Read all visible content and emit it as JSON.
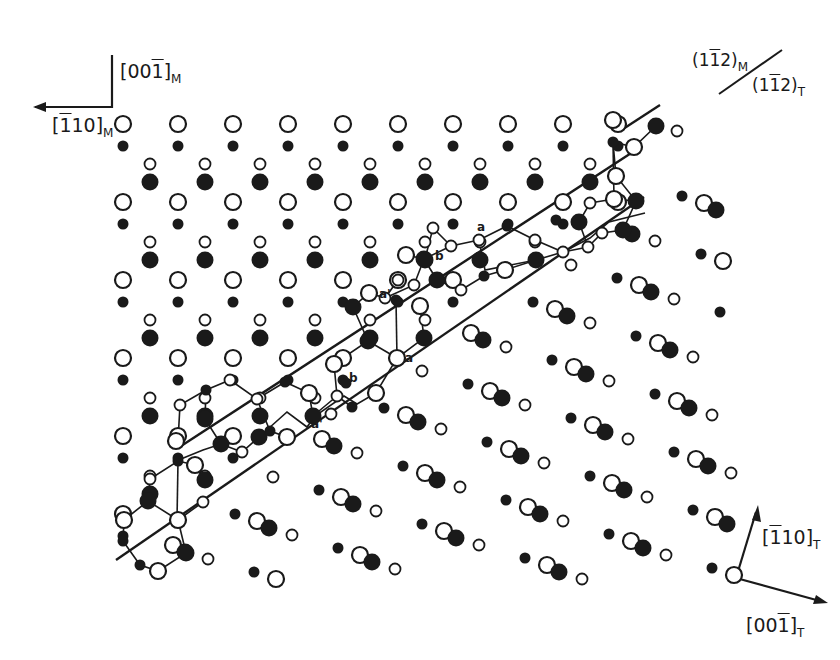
{
  "diagram": {
    "type": "crystal-lattice-interface",
    "colors": {
      "ink": "#1a1a1a",
      "background": "#ffffff"
    },
    "legend_atoms": [
      {
        "kind": "large-open",
        "meaning": "large open circle"
      },
      {
        "kind": "large-filled",
        "meaning": "large filled circle"
      },
      {
        "kind": "small-open",
        "meaning": "small open circle"
      },
      {
        "kind": "small-filled",
        "meaning": "small filled circle"
      }
    ]
  },
  "axes": {
    "martensite": {
      "vertical": {
        "pre": "[00",
        "bar_digit": "1",
        "post": "]",
        "sub": "M"
      },
      "horizontal": {
        "pre": "[",
        "bar_digit": "1",
        "post": "10]",
        "sub": "M"
      }
    },
    "parent": {
      "up": {
        "pre": "[",
        "bar_digit": "1",
        "post": "10]",
        "sub": "T"
      },
      "right": {
        "pre": "[00",
        "bar_digit": "1",
        "post": "]",
        "sub": "T"
      }
    }
  },
  "plane_label": {
    "upper": {
      "pre": "(1",
      "bar_digit": "1",
      "post": "2)",
      "sub": "M"
    },
    "lower": {
      "pre": "(1",
      "bar_digit": "1",
      "post": "2)",
      "sub": "T"
    }
  },
  "atom_labels": [
    {
      "text": "a",
      "x": 477,
      "y": 228
    },
    {
      "text": "b",
      "x": 435,
      "y": 256
    },
    {
      "text": "a'",
      "x": 379,
      "y": 294
    },
    {
      "text": "a",
      "x": 405,
      "y": 357
    },
    {
      "text": "b",
      "x": 349,
      "y": 376
    },
    {
      "text": "a'",
      "x": 311,
      "y": 423
    }
  ]
}
